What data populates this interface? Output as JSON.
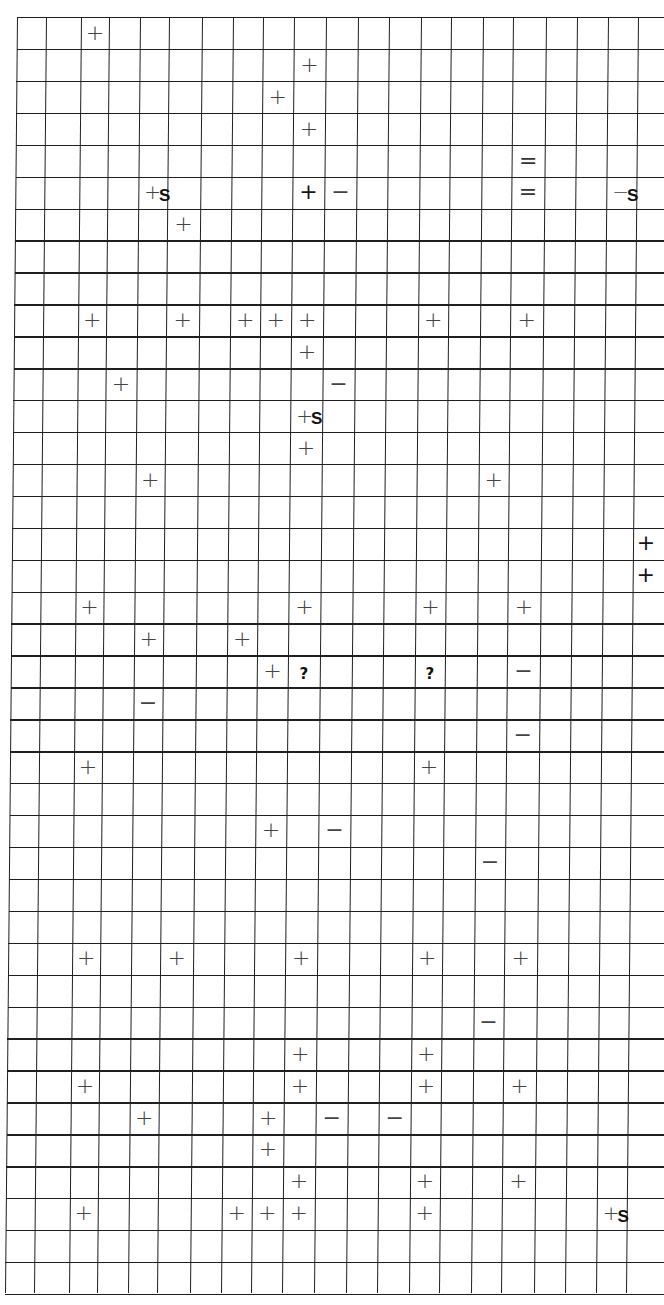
{
  "sheet": {
    "rows": 40,
    "cols": 21,
    "line_color": "#1f1f1f",
    "mark_color": "#444444",
    "col_edges_top": [
      17,
      46,
      81,
      109,
      140,
      169,
      202,
      233,
      263,
      294,
      326,
      358,
      389,
      421,
      451,
      483,
      513,
      546,
      577,
      608,
      638,
      664
    ],
    "col_shift_bottom": -12,
    "row_top": 17,
    "row_bottom": 1293
  },
  "legend": {
    "plus": "+",
    "minus": "−",
    "equals": "=",
    "question": "?",
    "plus_s": "+S",
    "minus_s": "−S"
  },
  "marks": [
    {
      "row": 0,
      "col": 2,
      "type": "plus",
      "glyph": "+"
    },
    {
      "row": 1,
      "col": 9,
      "type": "plus",
      "glyph": "+"
    },
    {
      "row": 2,
      "col": 8,
      "type": "plus",
      "glyph": "+"
    },
    {
      "row": 3,
      "col": 9,
      "type": "plus",
      "glyph": "+"
    },
    {
      "row": 4,
      "col": 16,
      "type": "equals",
      "glyph": "="
    },
    {
      "row": 5,
      "col": 4,
      "type": "plus_s",
      "glyph": "+",
      "suffix": "S"
    },
    {
      "row": 5,
      "col": 9,
      "type": "plus_dark",
      "glyph": "+"
    },
    {
      "row": 5,
      "col": 10,
      "type": "minus",
      "glyph": "−"
    },
    {
      "row": 5,
      "col": 16,
      "type": "equals",
      "glyph": "="
    },
    {
      "row": 5,
      "col": 19,
      "type": "minus_s",
      "glyph": "−",
      "suffix": "S"
    },
    {
      "row": 6,
      "col": 5,
      "type": "plus",
      "glyph": "+"
    },
    {
      "row": 9,
      "col": 2,
      "type": "plus",
      "glyph": "+"
    },
    {
      "row": 9,
      "col": 5,
      "type": "plus",
      "glyph": "+"
    },
    {
      "row": 9,
      "col": 7,
      "type": "plus",
      "glyph": "+"
    },
    {
      "row": 9,
      "col": 8,
      "type": "plus",
      "glyph": "+"
    },
    {
      "row": 9,
      "col": 9,
      "type": "plus",
      "glyph": "+"
    },
    {
      "row": 9,
      "col": 13,
      "type": "plus",
      "glyph": "+"
    },
    {
      "row": 9,
      "col": 16,
      "type": "plus",
      "glyph": "+"
    },
    {
      "row": 10,
      "col": 9,
      "type": "plus",
      "glyph": "+"
    },
    {
      "row": 11,
      "col": 3,
      "type": "plus",
      "glyph": "+"
    },
    {
      "row": 11,
      "col": 10,
      "type": "minus",
      "glyph": "−"
    },
    {
      "row": 12,
      "col": 9,
      "type": "plus_s",
      "glyph": "+",
      "suffix": "S"
    },
    {
      "row": 13,
      "col": 9,
      "type": "plus",
      "glyph": "+"
    },
    {
      "row": 14,
      "col": 4,
      "type": "plus",
      "glyph": "+"
    },
    {
      "row": 14,
      "col": 15,
      "type": "plus",
      "glyph": "+"
    },
    {
      "row": 16,
      "col": 20,
      "type": "plus_dark",
      "glyph": "+"
    },
    {
      "row": 17,
      "col": 20,
      "type": "plus_dark",
      "glyph": "+"
    },
    {
      "row": 18,
      "col": 2,
      "type": "plus",
      "glyph": "+"
    },
    {
      "row": 18,
      "col": 9,
      "type": "plus",
      "glyph": "+"
    },
    {
      "row": 18,
      "col": 13,
      "type": "plus",
      "glyph": "+"
    },
    {
      "row": 18,
      "col": 16,
      "type": "plus",
      "glyph": "+"
    },
    {
      "row": 19,
      "col": 4,
      "type": "plus",
      "glyph": "+"
    },
    {
      "row": 19,
      "col": 7,
      "type": "plus",
      "glyph": "+"
    },
    {
      "row": 20,
      "col": 8,
      "type": "plus",
      "glyph": "+"
    },
    {
      "row": 20,
      "col": 9,
      "type": "question",
      "glyph": "?"
    },
    {
      "row": 20,
      "col": 13,
      "type": "question",
      "glyph": "?"
    },
    {
      "row": 20,
      "col": 16,
      "type": "minus",
      "glyph": "−"
    },
    {
      "row": 21,
      "col": 4,
      "type": "minus",
      "glyph": "−"
    },
    {
      "row": 22,
      "col": 16,
      "type": "minus",
      "glyph": "−"
    },
    {
      "row": 23,
      "col": 2,
      "type": "plus",
      "glyph": "+"
    },
    {
      "row": 23,
      "col": 13,
      "type": "plus",
      "glyph": "+"
    },
    {
      "row": 25,
      "col": 8,
      "type": "plus",
      "glyph": "+"
    },
    {
      "row": 25,
      "col": 10,
      "type": "minus",
      "glyph": "−"
    },
    {
      "row": 26,
      "col": 15,
      "type": "minus",
      "glyph": "−"
    },
    {
      "row": 29,
      "col": 2,
      "type": "plus",
      "glyph": "+"
    },
    {
      "row": 29,
      "col": 5,
      "type": "plus",
      "glyph": "+"
    },
    {
      "row": 29,
      "col": 9,
      "type": "plus",
      "glyph": "+"
    },
    {
      "row": 29,
      "col": 13,
      "type": "plus",
      "glyph": "+"
    },
    {
      "row": 29,
      "col": 16,
      "type": "plus",
      "glyph": "+"
    },
    {
      "row": 31,
      "col": 15,
      "type": "minus",
      "glyph": "−"
    },
    {
      "row": 32,
      "col": 9,
      "type": "plus",
      "glyph": "+"
    },
    {
      "row": 32,
      "col": 13,
      "type": "plus",
      "glyph": "+"
    },
    {
      "row": 33,
      "col": 2,
      "type": "plus",
      "glyph": "+"
    },
    {
      "row": 33,
      "col": 9,
      "type": "plus",
      "glyph": "+"
    },
    {
      "row": 33,
      "col": 13,
      "type": "plus",
      "glyph": "+"
    },
    {
      "row": 33,
      "col": 16,
      "type": "plus",
      "glyph": "+"
    },
    {
      "row": 34,
      "col": 4,
      "type": "plus",
      "glyph": "+"
    },
    {
      "row": 34,
      "col": 8,
      "type": "plus",
      "glyph": "+"
    },
    {
      "row": 34,
      "col": 10,
      "type": "minus",
      "glyph": "−"
    },
    {
      "row": 34,
      "col": 12,
      "type": "minus",
      "glyph": "−"
    },
    {
      "row": 35,
      "col": 8,
      "type": "plus",
      "glyph": "+"
    },
    {
      "row": 36,
      "col": 9,
      "type": "plus",
      "glyph": "+"
    },
    {
      "row": 36,
      "col": 13,
      "type": "plus",
      "glyph": "+"
    },
    {
      "row": 36,
      "col": 16,
      "type": "plus",
      "glyph": "+"
    },
    {
      "row": 37,
      "col": 2,
      "type": "plus",
      "glyph": "+"
    },
    {
      "row": 37,
      "col": 7,
      "type": "plus",
      "glyph": "+"
    },
    {
      "row": 37,
      "col": 8,
      "type": "plus",
      "glyph": "+"
    },
    {
      "row": 37,
      "col": 9,
      "type": "plus",
      "glyph": "+"
    },
    {
      "row": 37,
      "col": 13,
      "type": "plus",
      "glyph": "+"
    },
    {
      "row": 37,
      "col": 19,
      "type": "plus_s",
      "glyph": "+",
      "suffix": "S"
    }
  ]
}
